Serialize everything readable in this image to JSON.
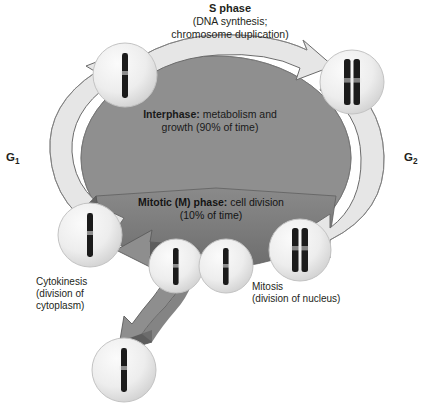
{
  "diagram": {
    "title_visible": false,
    "labels": {
      "s_phase_title": "S phase",
      "s_phase_line1": "(DNA synthesis;",
      "s_phase_line2": "chromosome duplication)",
      "interphase_bold": "Interphase:",
      "interphase_rest": " metabolism and",
      "interphase_line2": "growth (90% of time)",
      "mitotic_bold": "Mitotic (M) phase:",
      "mitotic_rest": " cell division",
      "mitotic_line2": "(10% of time)",
      "g1": "G",
      "g1_sub": "1",
      "g2": "G",
      "g2_sub": "2",
      "cytokinesis_line1": "Cytokinesis",
      "cytokinesis_line2": "(division of",
      "cytokinesis_line3": "cytoplasm)",
      "mitosis_line1": "Mitosis",
      "mitosis_line2": "(division of nucleus)"
    },
    "colors": {
      "background": "#ffffff",
      "center_oval": "#8c8c8c",
      "interphase_arrow": "#e2e2e2",
      "interphase_arrow_shadow": "#9b9b9b",
      "mitotic_wedge": "#767676",
      "mitotic_arrow": "#8f8f8f",
      "mitotic_arrow_dark": "#5e5e5e",
      "cell_fill": "#ececec",
      "cell_edge": "#b8b8b8",
      "chromosome": "#1b1b1b",
      "outline": "#5a5a5a"
    },
    "cells": [
      {
        "name": "cell-g1-top-left",
        "stage": "single chromosome",
        "cx": 125,
        "cy": 75,
        "r": 32,
        "chromosomes": 1
      },
      {
        "name": "cell-s-right",
        "stage": "duplicated chromosome",
        "cx": 352,
        "cy": 82,
        "r": 32,
        "chromosomes": 2
      },
      {
        "name": "cell-g2-mitosis-right",
        "stage": "duplicated chromosome",
        "cx": 300,
        "cy": 250,
        "r": 30,
        "chromosomes": 2
      },
      {
        "name": "cell-telophase-right",
        "stage": "single chromosome",
        "cx": 202,
        "cy": 265,
        "r": 26,
        "chromosomes": 1
      },
      {
        "name": "cell-telophase-left",
        "stage": "single chromosome",
        "cx": 174,
        "cy": 265,
        "r": 26,
        "chromosomes": 1
      },
      {
        "name": "cell-daughter-left",
        "stage": "single chromosome",
        "cx": 90,
        "cy": 235,
        "r": 32,
        "chromosomes": 1
      },
      {
        "name": "cell-daughter-bottom",
        "stage": "single chromosome",
        "cx": 124,
        "cy": 370,
        "r": 32,
        "chromosomes": 1
      }
    ]
  }
}
